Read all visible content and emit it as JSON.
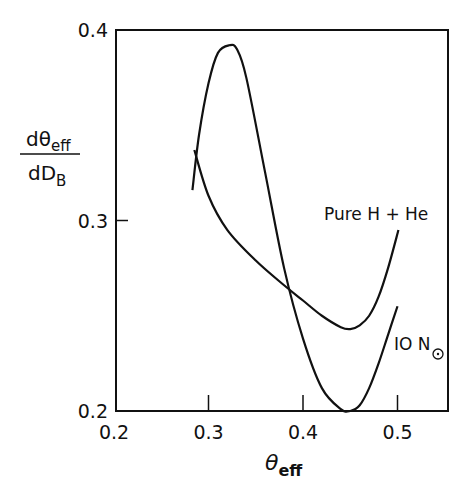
{
  "chart_data": {
    "type": "line",
    "title": "",
    "xlabel": "θ_eff",
    "ylabel": "dθ_eff / dD_B",
    "xlim": [
      0.2,
      0.555
    ],
    "ylim": [
      0.2,
      0.4
    ],
    "grid": false,
    "x_ticks": [
      "0.2",
      "0.3",
      "0.4",
      "0.5"
    ],
    "y_ticks": [
      "0.2",
      "0.3",
      "0.4"
    ],
    "series": [
      {
        "name": "Pure H + He",
        "x": [
          0.285,
          0.3,
          0.32,
          0.35,
          0.38,
          0.4,
          0.42,
          0.44,
          0.45,
          0.46,
          0.47,
          0.48,
          0.49,
          0.501
        ],
        "y": [
          0.337,
          0.313,
          0.295,
          0.279,
          0.266,
          0.258,
          0.25,
          0.244,
          0.243,
          0.245,
          0.25,
          0.26,
          0.275,
          0.295
        ]
      },
      {
        "name": "10 N☉",
        "x": [
          0.283,
          0.29,
          0.3,
          0.31,
          0.322,
          0.33,
          0.34,
          0.36,
          0.38,
          0.4,
          0.42,
          0.44,
          0.45,
          0.46,
          0.47,
          0.48,
          0.49,
          0.5
        ],
        "y": [
          0.316,
          0.345,
          0.372,
          0.388,
          0.392,
          0.39,
          0.375,
          0.325,
          0.275,
          0.238,
          0.212,
          0.201,
          0.2,
          0.203,
          0.212,
          0.225,
          0.24,
          0.255
        ]
      }
    ],
    "annotations": [
      {
        "text": "Pure H + He",
        "x": 0.46,
        "y": 0.302
      },
      {
        "text": "10 N☉",
        "x": 0.51,
        "y": 0.236
      }
    ],
    "legend": "inline annotations"
  },
  "labels": {
    "y_num": "dθ",
    "y_num_sub": "eff",
    "y_den": "dD",
    "y_den_sub": "B",
    "x_main": "θ",
    "x_sub": "eff",
    "pure": "Pure H + He",
    "ten": "IO N",
    "sun": "☉",
    "caption": "Figure 4"
  }
}
